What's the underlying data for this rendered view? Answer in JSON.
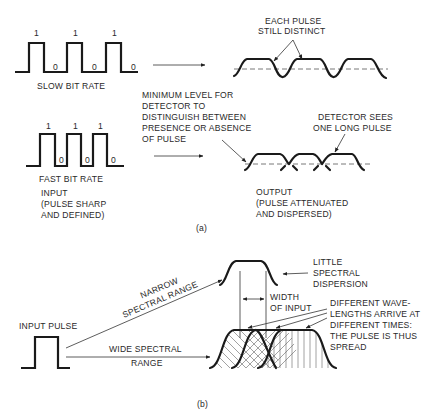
{
  "part_a": {
    "caption": "(a)",
    "slow_input": {
      "bits": [
        "1",
        "0",
        "1",
        "0",
        "1",
        "0"
      ],
      "label": "SLOW BIT RATE"
    },
    "fast_input": {
      "bits": [
        "1",
        "0",
        "1",
        "0",
        "1",
        "0"
      ],
      "label": "FAST BIT RATE"
    },
    "input_label": [
      "INPUT",
      "(PULSE SHARP",
      "AND DEFINED)"
    ],
    "slow_output_annotation": [
      "EACH PULSE",
      "STILL DISTINCT"
    ],
    "threshold_annotation": [
      "MINIMUM LEVEL FOR",
      "DETECTOR TO",
      "DISTINGUISH BETWEEN",
      "PRESENCE OR ABSENCE",
      "OF PULSE"
    ],
    "fast_output_annotation": [
      "DETECTOR SEES",
      "ONE LONG PULSE"
    ],
    "output_label": [
      "OUTPUT",
      "(PULSE ATTENUATED",
      "AND DISPERSED)"
    ]
  },
  "part_b": {
    "caption": "(b)",
    "input_label": "INPUT PULSE",
    "narrow_path_label": [
      "NARROW",
      "SPECTRAL RANGE"
    ],
    "wide_path_label": [
      "WIDE SPECTRAL",
      "RANGE"
    ],
    "narrow_annotation": [
      "LITTLE",
      "SPECTRAL",
      "DISPERSION"
    ],
    "width_annotation": [
      "WIDTH",
      "OF INPUT"
    ],
    "wide_annotation": [
      "DIFFERENT WAVE-",
      "LENGTHS ARRIVE AT",
      "DIFFERENT TIMES:",
      "THE PULSE IS THUS",
      "SPREAD"
    ]
  }
}
